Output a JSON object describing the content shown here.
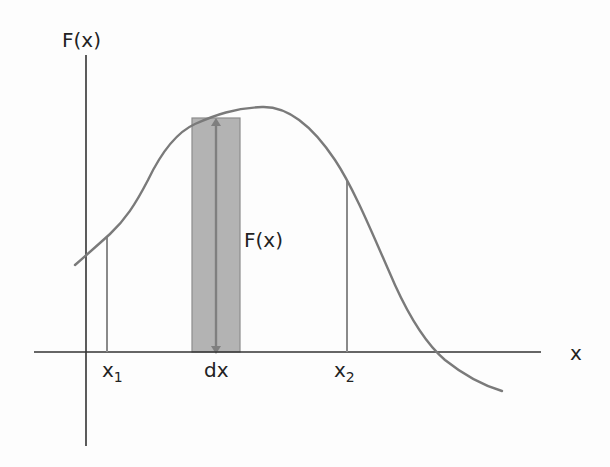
{
  "diagram": {
    "y_axis_label": "F(x)",
    "x_axis_label": "x",
    "strip_height_label": "F(x)",
    "strip_width_label": "dx",
    "lower_bound": {
      "base": "x",
      "subscript": "1"
    },
    "upper_bound": {
      "base": "x",
      "subscript": "2"
    },
    "colors": {
      "axis": "#333333",
      "curve": "#7a7a7a",
      "strip_fill": "#b3b3b3",
      "strip_border": "#8c8c8c",
      "arrow": "#7f7f7f",
      "bound_lines": "#8a8a8a",
      "text": "#222222"
    }
  }
}
